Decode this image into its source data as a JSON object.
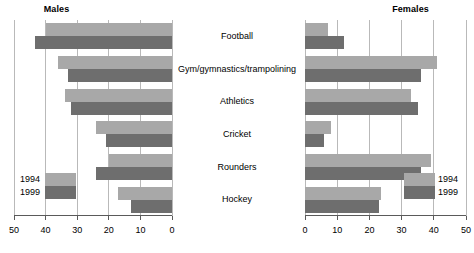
{
  "chart_data": {
    "type": "bar",
    "orientation": "horizontal",
    "layout": "butterfly-pair",
    "title": "",
    "categories": [
      "Football",
      "Gym/gymnastics/trampolining",
      "Athletics",
      "Cricket",
      "Rounders",
      "Hockey"
    ],
    "panels": [
      {
        "title": "Males",
        "xlabel": "",
        "ylabel": "",
        "xlim": [
          50,
          0
        ],
        "axis_direction": "reversed",
        "ticks": [
          50,
          40,
          30,
          20,
          10,
          0
        ],
        "tick_labels": [
          "50",
          "40",
          "30",
          "20",
          "10",
          "0"
        ],
        "grid": true,
        "series": [
          {
            "name": "1994",
            "color": "#a8a8a8",
            "values": [
              40,
              36,
              34,
              24,
              20,
              17
            ]
          },
          {
            "name": "1999",
            "color": "#6e6e6e",
            "values": [
              43.5,
              33,
              32,
              21,
              24,
              13
            ]
          }
        ]
      },
      {
        "title": "Females",
        "xlabel": "",
        "ylabel": "",
        "xlim": [
          0,
          50
        ],
        "axis_direction": "normal",
        "ticks": [
          0,
          10,
          20,
          30,
          40,
          50
        ],
        "tick_labels": [
          "0",
          "10",
          "20",
          "30",
          "40",
          "50"
        ],
        "grid": true,
        "series": [
          {
            "name": "1994",
            "color": "#a8a8a8",
            "values": [
              7,
              41,
              33,
              8,
              39,
              23.5
            ]
          },
          {
            "name": "1999",
            "color": "#6e6e6e",
            "values": [
              12,
              36,
              35,
              6,
              36,
              23
            ]
          }
        ]
      }
    ],
    "legend": {
      "position": "inside-bottom",
      "entries": [
        {
          "label": "1994",
          "color": "#a8a8a8"
        },
        {
          "label": "1999",
          "color": "#6e6e6e"
        }
      ]
    }
  },
  "panel_left": {
    "title": "Males",
    "ticks": [
      "50",
      "40",
      "30",
      "20",
      "10",
      "0"
    ],
    "legend": {
      "a": "1994",
      "b": "1999"
    }
  },
  "panel_right": {
    "title": "Females",
    "ticks": [
      "0",
      "10",
      "20",
      "30",
      "40",
      "50"
    ],
    "legend": {
      "a": "1994",
      "b": "1999"
    }
  },
  "categories": [
    "Football",
    "Gym/gymnastics/trampolining",
    "Athletics",
    "Cricket",
    "Rounders",
    "Hockey"
  ]
}
